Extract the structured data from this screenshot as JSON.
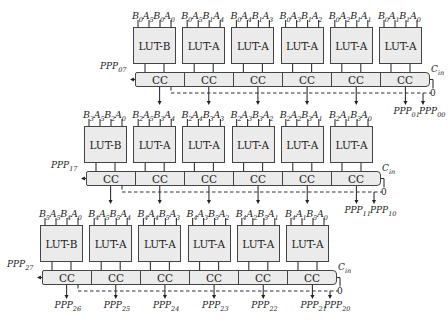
{
  "rows": [
    {
      "luts": [
        {
          "type": "LUT-B",
          "inputs": [
            [
              "B",
              "0"
            ],
            [
              "A",
              "5"
            ],
            [
              "B",
              "0"
            ],
            [
              "A",
              "0"
            ]
          ]
        },
        {
          "type": "LUT-A",
          "inputs": [
            [
              "B",
              "0"
            ],
            [
              "A",
              "5"
            ],
            [
              "B",
              "1"
            ],
            [
              "A",
              "4"
            ]
          ]
        },
        {
          "type": "LUT-A",
          "inputs": [
            [
              "B",
              "0"
            ],
            [
              "A",
              "4"
            ],
            [
              "B",
              "1"
            ],
            [
              "A",
              "3"
            ]
          ]
        },
        {
          "type": "LUT-A",
          "inputs": [
            [
              "B",
              "0"
            ],
            [
              "A",
              "3"
            ],
            [
              "B",
              "1"
            ],
            [
              "A",
              "2"
            ]
          ]
        },
        {
          "type": "LUT-A",
          "inputs": [
            [
              "B",
              "0"
            ],
            [
              "A",
              "2"
            ],
            [
              "B",
              "1"
            ],
            [
              "A",
              "1"
            ]
          ]
        },
        {
          "type": "LUT-A",
          "inputs": [
            [
              "B",
              "0"
            ],
            [
              "A",
              "1"
            ],
            [
              "B",
              "1"
            ],
            [
              "A",
              "0"
            ]
          ]
        }
      ],
      "cc_label": "CC",
      "carry_out": [
        "PPP",
        "07"
      ],
      "carry_in": [
        "C",
        "in"
      ],
      "carry_in_value": "0",
      "outputs": [
        [
          "PPP",
          "01"
        ],
        [
          "PPP",
          "00"
        ]
      ]
    },
    {
      "luts": [
        {
          "type": "LUT-B",
          "inputs": [
            [
              "B",
              "3"
            ],
            [
              "A",
              "5"
            ],
            [
              "B",
              "2"
            ],
            [
              "A",
              "0"
            ]
          ]
        },
        {
          "type": "LUT-A",
          "inputs": [
            [
              "B",
              "2"
            ],
            [
              "A",
              "5"
            ],
            [
              "B",
              "3"
            ],
            [
              "A",
              "4"
            ]
          ]
        },
        {
          "type": "LUT-A",
          "inputs": [
            [
              "B",
              "2"
            ],
            [
              "A",
              "4"
            ],
            [
              "B",
              "3"
            ],
            [
              "A",
              "3"
            ]
          ]
        },
        {
          "type": "LUT-A",
          "inputs": [
            [
              "B",
              "2"
            ],
            [
              "A",
              "3"
            ],
            [
              "B",
              "3"
            ],
            [
              "A",
              "2"
            ]
          ]
        },
        {
          "type": "LUT-A",
          "inputs": [
            [
              "B",
              "2"
            ],
            [
              "A",
              "2"
            ],
            [
              "B",
              "3"
            ],
            [
              "A",
              "1"
            ]
          ]
        },
        {
          "type": "LUT-A",
          "inputs": [
            [
              "B",
              "2"
            ],
            [
              "A",
              "1"
            ],
            [
              "B",
              "3"
            ],
            [
              "A",
              "0"
            ]
          ]
        }
      ],
      "cc_label": "CC",
      "carry_out": [
        "PPP",
        "17"
      ],
      "carry_in": [
        "C",
        "in"
      ],
      "carry_in_value": "0",
      "outputs": [
        [
          "PPP",
          "11"
        ],
        [
          "PPP",
          "10"
        ]
      ]
    },
    {
      "luts": [
        {
          "type": "LUT-B",
          "inputs": [
            [
              "B",
              "5"
            ],
            [
              "A",
              "5"
            ],
            [
              "B",
              "4"
            ],
            [
              "A",
              "0"
            ]
          ]
        },
        {
          "type": "LUT-A",
          "inputs": [
            [
              "B",
              "4"
            ],
            [
              "A",
              "5"
            ],
            [
              "B",
              "5"
            ],
            [
              "A",
              "4"
            ]
          ]
        },
        {
          "type": "LUT-A",
          "inputs": [
            [
              "B",
              "4"
            ],
            [
              "A",
              "4"
            ],
            [
              "B",
              "5"
            ],
            [
              "A",
              "3"
            ]
          ]
        },
        {
          "type": "LUT-A",
          "inputs": [
            [
              "B",
              "4"
            ],
            [
              "A",
              "3"
            ],
            [
              "B",
              "5"
            ],
            [
              "A",
              "2"
            ]
          ]
        },
        {
          "type": "LUT-A",
          "inputs": [
            [
              "B",
              "4"
            ],
            [
              "A",
              "2"
            ],
            [
              "B",
              "5"
            ],
            [
              "A",
              "1"
            ]
          ]
        },
        {
          "type": "LUT-A",
          "inputs": [
            [
              "B",
              "4"
            ],
            [
              "A",
              "1"
            ],
            [
              "B",
              "5"
            ],
            [
              "A",
              "0"
            ]
          ]
        }
      ],
      "cc_label": "CC",
      "carry_out": [
        "PPP",
        "27"
      ],
      "carry_in": [
        "C",
        "in"
      ],
      "carry_in_value": "0",
      "outputs": [
        [
          "PPP",
          "26"
        ],
        [
          "PPP",
          "25"
        ],
        [
          "PPP",
          "24"
        ],
        [
          "PPP",
          "23"
        ],
        [
          "PPP",
          "22"
        ],
        [
          "PPP",
          "21"
        ],
        [
          "PPP",
          "20"
        ]
      ]
    }
  ],
  "colors": {
    "block_fill": "#ebebeb",
    "stroke": "#444444"
  }
}
